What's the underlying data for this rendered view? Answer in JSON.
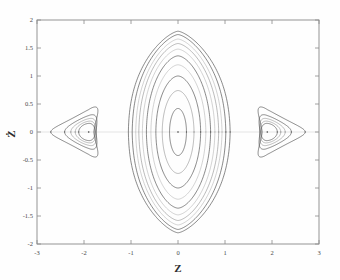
{
  "figure": {
    "title": "",
    "background_color": "#fefefe",
    "frame_color": "#8a8a8a"
  },
  "axes": {
    "x_title": "Z",
    "y_title": "Ż",
    "x_ticks": [
      "-3",
      "-2",
      "-1",
      "0",
      "1",
      "2",
      "3"
    ],
    "y_ticks": [
      "2",
      "1.5",
      "1",
      "0.5",
      "0",
      "-0.5",
      "-1",
      "-1.5",
      "-2"
    ]
  },
  "chart_data": {
    "type": "line",
    "title": "",
    "xlabel": "Z",
    "ylabel": "Ż",
    "xlim": [
      -3,
      3
    ],
    "ylim": [
      -2,
      2
    ],
    "xticks": [
      -3,
      -2,
      -1,
      0,
      1,
      2,
      3
    ],
    "yticks": [
      2,
      1.5,
      1,
      0.5,
      0,
      -0.5,
      -1,
      -1.5,
      -2
    ],
    "grid": false,
    "legend": null,
    "series": [
      {
        "name": "central-orbit-1",
        "kind": "closed-contour",
        "shade": "dark",
        "center": [
          0,
          0
        ],
        "z_half_width": 0.18,
        "zdot_half_height": 0.42,
        "apex_sharpness": 0.05,
        "bulge": 0.0
      },
      {
        "name": "central-orbit-2",
        "kind": "closed-contour",
        "shade": "mid",
        "center": [
          0,
          0
        ],
        "z_half_width": 0.33,
        "zdot_half_height": 0.74,
        "apex_sharpness": 0.12,
        "bulge": 0.02
      },
      {
        "name": "central-orbit-3",
        "kind": "closed-contour",
        "shade": "dark",
        "center": [
          0,
          0
        ],
        "z_half_width": 0.46,
        "zdot_half_height": 1.0,
        "apex_sharpness": 0.2,
        "bulge": 0.04
      },
      {
        "name": "central-orbit-4",
        "kind": "closed-contour",
        "shade": "faint",
        "center": [
          0,
          0
        ],
        "z_half_width": 0.56,
        "zdot_half_height": 1.2,
        "apex_sharpness": 0.28,
        "bulge": 0.06
      },
      {
        "name": "central-orbit-5",
        "kind": "closed-contour",
        "shade": "dark",
        "center": [
          0,
          0
        ],
        "z_half_width": 0.65,
        "zdot_half_height": 1.36,
        "apex_sharpness": 0.36,
        "bulge": 0.08
      },
      {
        "name": "central-orbit-6",
        "kind": "closed-contour",
        "shade": "faint",
        "center": [
          0,
          0
        ],
        "z_half_width": 0.73,
        "zdot_half_height": 1.48,
        "apex_sharpness": 0.44,
        "bulge": 0.1
      },
      {
        "name": "central-orbit-7",
        "kind": "closed-contour",
        "shade": "mid",
        "center": [
          0,
          0
        ],
        "z_half_width": 0.8,
        "zdot_half_height": 1.58,
        "apex_sharpness": 0.52,
        "bulge": 0.12
      },
      {
        "name": "central-orbit-8",
        "kind": "closed-contour",
        "shade": "faint",
        "center": [
          0,
          0
        ],
        "z_half_width": 0.86,
        "zdot_half_height": 1.66,
        "apex_sharpness": 0.6,
        "bulge": 0.14
      },
      {
        "name": "central-orbit-9",
        "kind": "closed-contour",
        "shade": "dark",
        "center": [
          0,
          0
        ],
        "z_half_width": 0.93,
        "zdot_half_height": 1.74,
        "apex_sharpness": 0.68,
        "bulge": 0.16
      },
      {
        "name": "central-separatrix",
        "kind": "closed-contour",
        "shade": "sep",
        "center": [
          0,
          0
        ],
        "z_half_width": 1.0,
        "zdot_half_height": 1.8,
        "apex_sharpness": 0.76,
        "bulge": 0.2
      },
      {
        "name": "left-island-core",
        "kind": "island",
        "shade": "dark",
        "center": [
          -1.9,
          0
        ],
        "scale": 0.12,
        "orientation": "left"
      },
      {
        "name": "left-island-2",
        "kind": "island",
        "shade": "mid",
        "center": [
          -1.9,
          0
        ],
        "scale": 0.26,
        "orientation": "left"
      },
      {
        "name": "left-island-3",
        "kind": "island",
        "shade": "mid",
        "center": [
          -1.9,
          0
        ],
        "scale": 0.42,
        "orientation": "left"
      },
      {
        "name": "left-island-4",
        "kind": "island",
        "shade": "dark",
        "center": [
          -1.9,
          0
        ],
        "scale": 0.62,
        "orientation": "left"
      },
      {
        "name": "left-island-separatrix",
        "kind": "island",
        "shade": "sep",
        "center": [
          -1.9,
          0
        ],
        "scale": 1.0,
        "orientation": "left"
      },
      {
        "name": "right-island-core",
        "kind": "island",
        "shade": "dark",
        "center": [
          1.9,
          0
        ],
        "scale": 0.12,
        "orientation": "right"
      },
      {
        "name": "right-island-2",
        "kind": "island",
        "shade": "mid",
        "center": [
          1.9,
          0
        ],
        "scale": 0.26,
        "orientation": "right"
      },
      {
        "name": "right-island-3",
        "kind": "island",
        "shade": "mid",
        "center": [
          1.9,
          0
        ],
        "scale": 0.42,
        "orientation": "right"
      },
      {
        "name": "right-island-4",
        "kind": "island",
        "shade": "dark",
        "center": [
          1.9,
          0
        ],
        "scale": 0.62,
        "orientation": "right"
      },
      {
        "name": "right-island-separatrix",
        "kind": "island",
        "shade": "sep",
        "center": [
          1.9,
          0
        ],
        "scale": 1.0,
        "orientation": "right"
      }
    ],
    "fixed_points": [
      {
        "name": "center-elliptic-point",
        "z": 0,
        "zdot": 0
      },
      {
        "name": "left-island-elliptic-point",
        "z": -1.9,
        "zdot": 0
      },
      {
        "name": "right-island-elliptic-point",
        "z": 1.9,
        "zdot": 0
      }
    ]
  }
}
